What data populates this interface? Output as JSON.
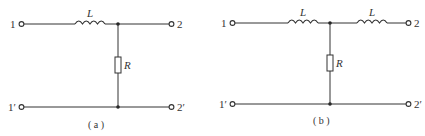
{
  "figures": [
    {
      "caption": "( a )",
      "terminals": {
        "in_top": "1",
        "out_top": "2",
        "in_bottom": "1′",
        "out_bottom": "2′"
      },
      "components": [
        {
          "type": "inductor",
          "label": "L",
          "position": "series-top"
        },
        {
          "type": "resistor",
          "label": "R",
          "position": "shunt"
        }
      ]
    },
    {
      "caption": "( b )",
      "terminals": {
        "in_top": "1",
        "out_top": "2",
        "in_bottom": "1′",
        "out_bottom": "2′"
      },
      "components": [
        {
          "type": "inductor",
          "label": "L",
          "position": "series-top-left"
        },
        {
          "type": "inductor",
          "label": "L",
          "position": "series-top-right"
        },
        {
          "type": "resistor",
          "label": "R",
          "position": "shunt"
        }
      ]
    }
  ]
}
